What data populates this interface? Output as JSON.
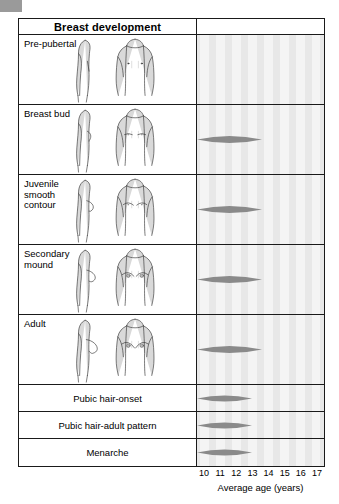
{
  "figure": {
    "header": {
      "title": "Breast development"
    },
    "stages": [
      {
        "label": "Pre-pubertal",
        "art": "flat-chest-profile-and-front",
        "marker": null
      },
      {
        "label": "Breast bud",
        "art": "breast-bud-profile-and-front",
        "marker": {
          "start_age": 10.0,
          "end_age": 12.1,
          "peak_age": 11.0
        }
      },
      {
        "label": "Juvenile\nsmooth\ncontour",
        "art": "juvenile-smooth-contour-profile-and-front",
        "marker": {
          "start_age": 10.9,
          "end_age": 13.0,
          "peak_age": 11.9
        }
      },
      {
        "label": "Secondary\nmound",
        "art": "secondary-mound-profile-and-front",
        "marker": {
          "start_age": 11.6,
          "end_age": 14.1,
          "peak_age": 12.8
        }
      },
      {
        "label": "Adult",
        "art": "adult-breast-profile-and-front",
        "marker": {
          "start_age": 12.5,
          "end_age": 16.1,
          "peak_age": 14.3
        }
      }
    ],
    "events": [
      {
        "label": "Pubic hair-onset",
        "marker": {
          "start_age": 9.8,
          "end_age": 13.2,
          "peak_age": 11.5
        }
      },
      {
        "label": "Pubic hair-adult pattern",
        "marker": {
          "start_age": 12.4,
          "end_age": 16.8,
          "peak_age": 14.6
        }
      },
      {
        "label": "Menarche",
        "marker": {
          "start_age": 11.4,
          "end_age": 14.6,
          "peak_age": 13.0
        }
      }
    ]
  },
  "chart_data": {
    "type": "bar",
    "title": "Breast development",
    "xlabel": "Average age (years)",
    "ylabel": "",
    "xlim": [
      9.5,
      17.5
    ],
    "grid": true,
    "legend": null,
    "categories": [
      "Pre-pubertal",
      "Breast bud",
      "Juvenile smooth contour",
      "Secondary mound",
      "Adult",
      "Pubic hair-onset",
      "Pubic hair-adult pattern",
      "Menarche"
    ],
    "tick_labels": [
      "10",
      "11",
      "12",
      "13",
      "14",
      "15",
      "16",
      "17"
    ],
    "tick_values": [
      10,
      11,
      12,
      13,
      14,
      15,
      16,
      17
    ],
    "series": [
      {
        "name": "Age range (lens marker)",
        "values": [
          null,
          {
            "start": 10.0,
            "peak": 11.0,
            "end": 12.1
          },
          {
            "start": 10.9,
            "peak": 11.9,
            "end": 13.0
          },
          {
            "start": 11.6,
            "peak": 12.8,
            "end": 14.1
          },
          {
            "start": 12.5,
            "peak": 14.3,
            "end": 16.1
          },
          {
            "start": 9.8,
            "peak": 11.5,
            "end": 13.2
          },
          {
            "start": 12.4,
            "peak": 14.6,
            "end": 16.8
          },
          {
            "start": 11.4,
            "peak": 13.0,
            "end": 14.6
          }
        ]
      }
    ]
  },
  "colors": {
    "marker": "#8a8a8a",
    "chart_background": "#e8e8e8",
    "band": "#f4f4f4",
    "border": "#1a1a1a",
    "art_fill": "#d9d9d9",
    "art_stroke": "#2b2b2b"
  },
  "axis": {
    "title": "Average age (years)",
    "ticks": [
      "10",
      "11",
      "12",
      "13",
      "14",
      "15",
      "16",
      "17"
    ]
  }
}
